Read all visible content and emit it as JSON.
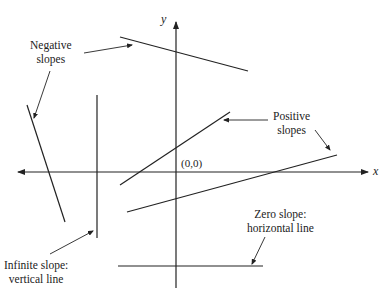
{
  "diagram": {
    "axes": {
      "x_label": "x",
      "y_label": "y",
      "origin_label": "(0,0)"
    },
    "labels": {
      "negative": [
        "Negative",
        "slopes"
      ],
      "positive": [
        "Positive",
        "slopes"
      ],
      "infinite": [
        "Infinite slope:",
        "vertical line"
      ],
      "zero": [
        "Zero slope:",
        "horizontal line"
      ]
    },
    "lines": [
      {
        "name": "negative-slope-top",
        "type": "negative",
        "from": [
          120,
          37
        ],
        "to": [
          248,
          71
        ]
      },
      {
        "name": "negative-slope-left",
        "type": "negative",
        "from": [
          27,
          105
        ],
        "to": [
          65,
          222
        ]
      },
      {
        "name": "vertical-line",
        "type": "infinite",
        "from": [
          97,
          95
        ],
        "to": [
          97,
          238
        ]
      },
      {
        "name": "positive-slope-upper",
        "type": "positive",
        "from": [
          120,
          185
        ],
        "to": [
          230,
          112
        ]
      },
      {
        "name": "positive-slope-lower",
        "type": "positive",
        "from": [
          127,
          212
        ],
        "to": [
          337,
          155
        ]
      },
      {
        "name": "horizontal-line",
        "type": "zero",
        "from": [
          118,
          266
        ],
        "to": [
          263,
          266
        ]
      }
    ],
    "colors": {
      "ink": "#222222",
      "background": "#ffffff"
    }
  }
}
